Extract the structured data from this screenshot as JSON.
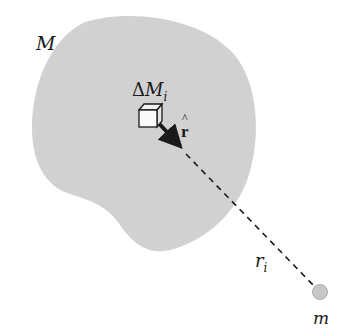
{
  "figure": {
    "type": "gravitational field diagram",
    "body": {
      "label": "M",
      "fill": "#d4d4d4"
    },
    "element": {
      "label_prefix": "Δ",
      "label_main": "M",
      "label_sub": "i"
    },
    "unit_vector": {
      "label": "r",
      "hat": "^"
    },
    "distance": {
      "label_main": "r",
      "label_sub": "i"
    },
    "point_mass": {
      "label": "m",
      "fill": "#c8c8c8"
    }
  },
  "colors": {
    "background": "#ffffff",
    "body_fill": "#d4d4d4",
    "ink": "#1a1a1a"
  }
}
